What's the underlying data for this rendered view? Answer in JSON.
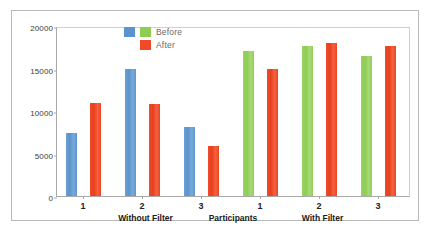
{
  "chart_data": {
    "type": "bar",
    "title": "",
    "xlabel": "Participants",
    "ylabel": "",
    "ylim": [
      0,
      20000
    ],
    "yticks": [
      0,
      5000,
      10000,
      15000,
      20000
    ],
    "ytick_labels": [
      "0",
      "5000",
      "10000",
      "15000",
      "20000"
    ],
    "grid": false,
    "legend": {
      "position": "top-center",
      "entries": [
        {
          "label": "Before",
          "colors": [
            "#5b93cd",
            "#8fcd52"
          ]
        },
        {
          "label": "After",
          "colors": [
            "#ef4b2a"
          ]
        }
      ]
    },
    "groups": [
      {
        "name": "Without Filter",
        "categories": [
          "1",
          "2",
          "3"
        ]
      },
      {
        "name": "With Filter",
        "categories": [
          "1",
          "2",
          "3"
        ]
      }
    ],
    "categories": [
      "1",
      "2",
      "3",
      "1",
      "2",
      "3"
    ],
    "series": [
      {
        "name": "Before",
        "values": [
          7400,
          15000,
          8100,
          17100,
          17600,
          16500
        ]
      },
      {
        "name": "After",
        "values": [
          10900,
          10800,
          5900,
          14900,
          18000,
          17600
        ]
      }
    ],
    "bars": [
      {
        "group": "Without Filter",
        "participant": "1",
        "series": "Before",
        "value": 7400,
        "color": "#5b93cd"
      },
      {
        "group": "Without Filter",
        "participant": "1",
        "series": "After",
        "value": 10900,
        "color": "#ef4b2a"
      },
      {
        "group": "Without Filter",
        "participant": "2",
        "series": "Before",
        "value": 15000,
        "color": "#5b93cd"
      },
      {
        "group": "Without Filter",
        "participant": "2",
        "series": "After",
        "value": 10800,
        "color": "#ef4b2a"
      },
      {
        "group": "Without Filter",
        "participant": "3",
        "series": "Before",
        "value": 8100,
        "color": "#5b93cd"
      },
      {
        "group": "Without Filter",
        "participant": "3",
        "series": "After",
        "value": 5900,
        "color": "#ef4b2a"
      },
      {
        "group": "With Filter",
        "participant": "1",
        "series": "Before",
        "value": 17100,
        "color": "#8fcd52"
      },
      {
        "group": "With Filter",
        "participant": "1",
        "series": "After",
        "value": 14900,
        "color": "#ef4b2a"
      },
      {
        "group": "With Filter",
        "participant": "2",
        "series": "Before",
        "value": 17600,
        "color": "#8fcd52"
      },
      {
        "group": "With Filter",
        "participant": "2",
        "series": "After",
        "value": 18000,
        "color": "#ef4b2a"
      },
      {
        "group": "With Filter",
        "participant": "3",
        "series": "Before",
        "value": 16500,
        "color": "#8fcd52"
      },
      {
        "group": "With Filter",
        "participant": "3",
        "series": "After",
        "value": 17600,
        "color": "#ef4b2a"
      }
    ]
  }
}
